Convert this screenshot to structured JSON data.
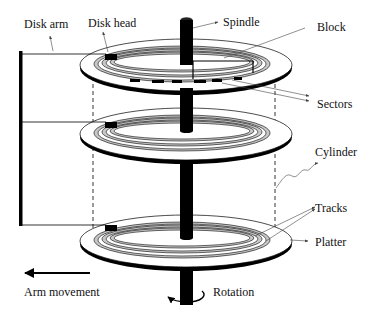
{
  "labels": {
    "disk_arm": "Disk arm",
    "disk_head": "Disk head",
    "spindle": "Spindle",
    "block": "Block",
    "sectors": "Sectors",
    "cylinder": "Cylinder",
    "tracks": "Tracks",
    "platter": "Platter",
    "arm_movement": "Arm movement",
    "rotation": "Rotation"
  },
  "components": {
    "platters": 3,
    "heads": 3,
    "colors": {
      "ink": "#000000",
      "track_fill": "#c8c8c8",
      "background": "#ffffff"
    }
  }
}
